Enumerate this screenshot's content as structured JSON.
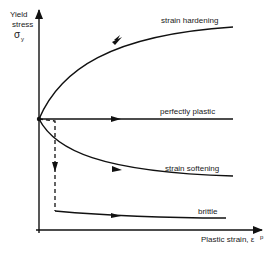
{
  "diagram": {
    "y_axis_label_line1": "Yield",
    "y_axis_label_line2": "stress",
    "y_axis_symbol": "σ",
    "y_axis_subscript": "y",
    "x_axis_label": "Plastic strain, ε",
    "x_axis_superscript": "p",
    "curves": [
      {
        "name": "strain hardening",
        "label": "strain hardening"
      },
      {
        "name": "perfectly plastic",
        "label": "perfectly plastic"
      },
      {
        "name": "strain softening",
        "label": "strain softening"
      },
      {
        "name": "brittle",
        "label": "brittle"
      }
    ],
    "line_color": "#111111"
  }
}
